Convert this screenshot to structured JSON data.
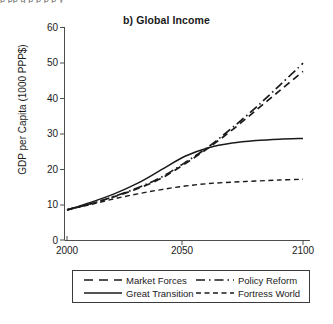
{
  "figure": {
    "cut_off_top_text": "p  pp      g  p            p         p  p  y",
    "title": "b) Global Income"
  },
  "chart_data": {
    "type": "line",
    "title": "b) Global Income",
    "xlabel": "",
    "ylabel": "GDP per Capita (1000 PPP$)",
    "xlim": [
      2000,
      2100
    ],
    "ylim": [
      0,
      60
    ],
    "xticks": [
      2000,
      2050,
      2100
    ],
    "yticks": [
      0,
      10,
      20,
      30,
      40,
      50,
      60
    ],
    "grid": false,
    "legend_position": "bottom",
    "x": [
      2000,
      2010,
      2020,
      2030,
      2040,
      2050,
      2060,
      2070,
      2080,
      2090,
      2100
    ],
    "series": [
      {
        "name": "Market Forces",
        "style": "dashed",
        "values": [
          8.5,
          10.2,
          12.2,
          14.5,
          17.4,
          21.5,
          26.0,
          31.0,
          36.5,
          42.0,
          47.5
        ]
      },
      {
        "name": "Great Transition",
        "style": "solid",
        "values": [
          8.5,
          10.6,
          13.0,
          16.0,
          19.8,
          23.6,
          26.0,
          27.3,
          28.0,
          28.4,
          28.6
        ]
      },
      {
        "name": "Policy Reform",
        "style": "dash-dot",
        "values": [
          8.5,
          10.2,
          12.3,
          14.7,
          17.7,
          21.8,
          26.3,
          31.6,
          37.3,
          43.5,
          49.8
        ]
      },
      {
        "name": "Fortress World",
        "style": "fine-dashed",
        "values": [
          8.5,
          10.0,
          11.6,
          13.0,
          14.2,
          15.2,
          15.9,
          16.3,
          16.6,
          16.9,
          17.1
        ]
      }
    ]
  },
  "axis": {
    "y_tick_labels": [
      "60",
      "50",
      "40",
      "30",
      "20",
      "10",
      "0"
    ],
    "x_tick_labels": [
      "2000",
      "2050",
      "2100"
    ]
  },
  "legend": {
    "items": [
      {
        "label": "Market Forces",
        "style": "dashed"
      },
      {
        "label": "Policy Reform",
        "style": "dash-dot"
      },
      {
        "label": "Great Transition",
        "style": "solid"
      },
      {
        "label": "Fortress World",
        "style": "fine-dashed"
      }
    ]
  },
  "colors": {
    "line": "#1a1a1a",
    "axis": "#4d4d4d",
    "background": "#ffffff"
  }
}
